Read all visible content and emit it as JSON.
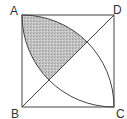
{
  "diagram": {
    "type": "geometry",
    "labels": {
      "A": "A",
      "B": "B",
      "C": "C",
      "D": "D"
    },
    "vertices": {
      "A": [
        22,
        15
      ],
      "D": [
        114,
        15
      ],
      "B": [
        22,
        107
      ],
      "C": [
        114,
        107
      ]
    },
    "side_px": 92,
    "arcs": [
      {
        "center": "B",
        "from": "A",
        "to": "C"
      },
      {
        "center": "D",
        "from": "A",
        "to": "C"
      }
    ],
    "diagonal": [
      "B",
      "D"
    ],
    "shaded_region": "part of lens between arcs lying above diagonal BD",
    "colors": {
      "stroke": "#444444",
      "shade": "#b8b8b8",
      "background": "#ffffff"
    }
  }
}
